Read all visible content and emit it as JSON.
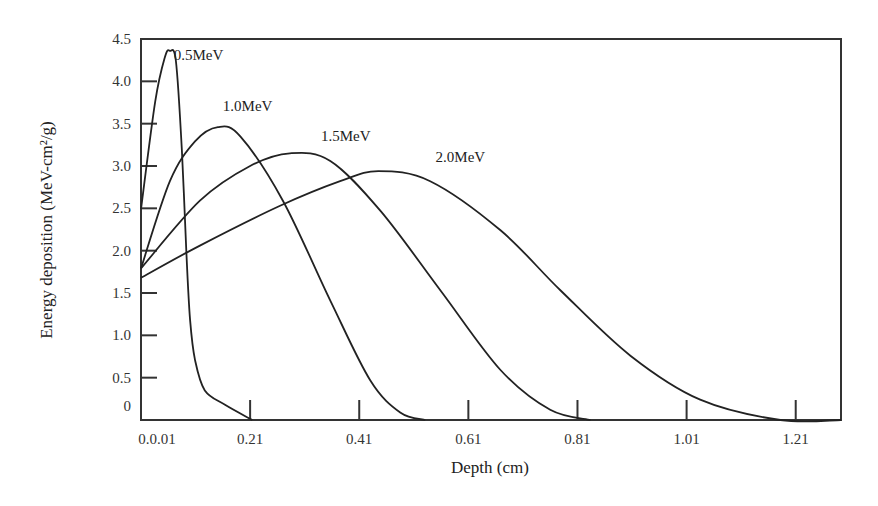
{
  "chart_data": {
    "type": "line",
    "title": "",
    "xlabel": "Depth (cm)",
    "ylabel": "Energy deposition (MeV-cm²/g)",
    "xlim": [
      0.01,
      1.293
    ],
    "ylim": [
      0,
      4.5
    ],
    "grid": false,
    "legend": "inline labels near curves",
    "x_ticks": [
      {
        "value": 0.01,
        "label": "0.0.01"
      },
      {
        "value": 0.21,
        "label": "0.21"
      },
      {
        "value": 0.41,
        "label": "0.41"
      },
      {
        "value": 0.61,
        "label": "0.61"
      },
      {
        "value": 0.81,
        "label": "0.81"
      },
      {
        "value": 1.01,
        "label": "1.01"
      },
      {
        "value": 1.21,
        "label": "1.21"
      }
    ],
    "y_ticks": [
      {
        "value": 0,
        "label": "0"
      },
      {
        "value": 0.5,
        "label": "0.5"
      },
      {
        "value": 1.0,
        "label": "1.0"
      },
      {
        "value": 1.5,
        "label": "1.5"
      },
      {
        "value": 2.0,
        "label": "2.0"
      },
      {
        "value": 2.5,
        "label": "2.5"
      },
      {
        "value": 3.0,
        "label": "3.0"
      },
      {
        "value": 3.5,
        "label": "3.5"
      },
      {
        "value": 4.0,
        "label": "4.0"
      },
      {
        "value": 4.5,
        "label": "4.5"
      }
    ],
    "series": [
      {
        "name": "0.5MeV",
        "label_pos": [
          0.07,
          4.25
        ],
        "x": [
          0.01,
          0.036,
          0.054,
          0.063,
          0.074,
          0.085,
          0.093,
          0.1,
          0.109,
          0.127,
          0.164,
          0.214
        ],
        "y": [
          2.49,
          3.76,
          4.29,
          4.36,
          4.24,
          3.18,
          2.0,
          1.18,
          0.71,
          0.35,
          0.18,
          0.0
        ]
      },
      {
        "name": "1.0MeV",
        "label_pos": [
          0.16,
          3.65
        ],
        "x": [
          0.01,
          0.063,
          0.109,
          0.151,
          0.192,
          0.27,
          0.357,
          0.43,
          0.485,
          0.531
        ],
        "y": [
          1.79,
          2.82,
          3.29,
          3.46,
          3.35,
          2.59,
          1.41,
          0.47,
          0.09,
          0.0
        ]
      },
      {
        "name": "1.5MeV",
        "label_pos": [
          0.34,
          3.3
        ],
        "x": [
          0.01,
          0.118,
          0.21,
          0.283,
          0.357,
          0.449,
          0.559,
          0.669,
          0.76,
          0.834
        ],
        "y": [
          1.79,
          2.59,
          3.0,
          3.15,
          3.06,
          2.47,
          1.53,
          0.59,
          0.12,
          0.0
        ]
      },
      {
        "name": "2.0MeV",
        "label_pos": [
          0.55,
          3.05
        ],
        "x": [
          0.01,
          0.118,
          0.265,
          0.375,
          0.445,
          0.54,
          0.669,
          0.779,
          0.907,
          1.035,
          1.182,
          1.293
        ],
        "y": [
          1.68,
          2.06,
          2.53,
          2.82,
          2.94,
          2.82,
          2.24,
          1.53,
          0.76,
          0.24,
          0.0,
          0.0
        ]
      }
    ]
  },
  "colors": {
    "line": "#222222",
    "axis": "#333333",
    "background": "#ffffff"
  }
}
